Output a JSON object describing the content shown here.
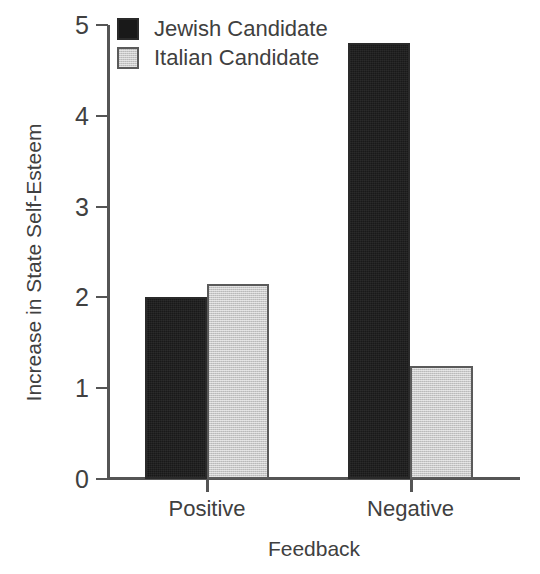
{
  "chart_data": {
    "type": "bar",
    "title": "",
    "categories": [
      "Positive",
      "Negative"
    ],
    "series": [
      {
        "name": "Jewish Candidate",
        "values": [
          2.0,
          4.8
        ],
        "color": "#191919"
      },
      {
        "name": "Italian Candidate",
        "values": [
          2.15,
          1.25
        ],
        "color": "#c9c9c9"
      }
    ],
    "xlabel": "Feedback",
    "ylabel": "Increase in State Self-Esteem",
    "ylim": [
      0,
      5
    ],
    "ytick_labels": [
      "0",
      "1",
      "2",
      "3",
      "4",
      "5"
    ],
    "ytick_values": [
      0,
      1,
      2,
      3,
      4,
      5
    ],
    "grid": false,
    "legend_position": "top-left",
    "legend_entries": [
      "Jewish Candidate",
      "Italian Candidate"
    ]
  }
}
